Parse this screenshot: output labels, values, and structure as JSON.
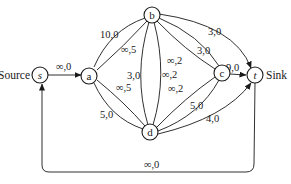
{
  "diagram": {
    "source_label": "Source",
    "sink_label": "Sink",
    "nodes": {
      "s": {
        "label": "s"
      },
      "a": {
        "label": "a"
      },
      "b": {
        "label": "b"
      },
      "c": {
        "label": "c"
      },
      "d": {
        "label": "d"
      },
      "t": {
        "label": "t"
      }
    },
    "edges": {
      "s_a": {
        "from": "s",
        "to": "a",
        "label": "∞,0"
      },
      "a_b": {
        "from": "a",
        "to": "b",
        "label": "10,0"
      },
      "a_b2": {
        "from": "a",
        "to": "b",
        "label": "∞,5"
      },
      "a_d": {
        "from": "a",
        "to": "d",
        "label": "5,0"
      },
      "a_d2": {
        "from": "a",
        "to": "d",
        "label": "∞,5"
      },
      "b_d": {
        "from": "b",
        "to": "d",
        "label": "3,0"
      },
      "b_d2": {
        "from": "b",
        "to": "d",
        "label": "∞,2"
      },
      "b_c": {
        "from": "b",
        "to": "c",
        "label": "3,0"
      },
      "b_c2": {
        "from": "b",
        "to": "c",
        "label": "∞,2"
      },
      "b_t": {
        "from": "b",
        "to": "t",
        "label": "3,0"
      },
      "c_d": {
        "from": "c",
        "to": "d",
        "label": "5,0"
      },
      "c_d2": {
        "from": "c",
        "to": "d",
        "label": "∞,2"
      },
      "c_t": {
        "from": "c",
        "to": "t",
        "label": "9,0"
      },
      "d_t": {
        "from": "d",
        "to": "t",
        "label": "4,0"
      },
      "t_s": {
        "from": "t",
        "to": "s",
        "label": "∞,0"
      }
    }
  }
}
